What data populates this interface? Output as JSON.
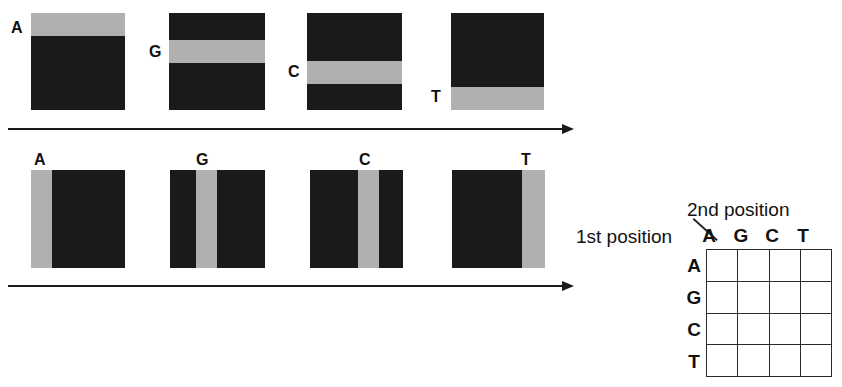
{
  "figure": {
    "title": "",
    "background_color": "#ffffff",
    "dark_color": "#1a1a1a",
    "band_color": "#b0b0b0"
  },
  "row1": {
    "description": "First position: horizontal band tiles",
    "tiles": [
      {
        "label": "A",
        "band_orientation": "horizontal",
        "band_position": "top"
      },
      {
        "label": "G",
        "band_orientation": "horizontal",
        "band_position": "upper-middle"
      },
      {
        "label": "C",
        "band_orientation": "horizontal",
        "band_position": "lower-middle"
      },
      {
        "label": "T",
        "band_orientation": "horizontal",
        "band_position": "bottom"
      }
    ],
    "arrow": {
      "direction": "right"
    }
  },
  "row2": {
    "description": "Second position: vertical band tiles",
    "tiles": [
      {
        "label": "A",
        "band_orientation": "vertical",
        "band_position": "left"
      },
      {
        "label": "G",
        "band_orientation": "vertical",
        "band_position": "left-middle"
      },
      {
        "label": "C",
        "band_orientation": "vertical",
        "band_position": "right-middle"
      },
      {
        "label": "T",
        "band_orientation": "vertical",
        "band_position": "right"
      }
    ],
    "arrow": {
      "direction": "right"
    }
  },
  "matrix": {
    "column_axis_title": "2nd position",
    "row_axis_title": "1st position",
    "column_headers": [
      "A",
      "G",
      "C",
      "T"
    ],
    "row_headers": [
      "A",
      "G",
      "C",
      "T"
    ],
    "cells": [
      [
        "",
        "",
        "",
        ""
      ],
      [
        "",
        "",
        "",
        ""
      ],
      [
        "",
        "",
        "",
        ""
      ],
      [
        "",
        "",
        "",
        ""
      ]
    ]
  }
}
